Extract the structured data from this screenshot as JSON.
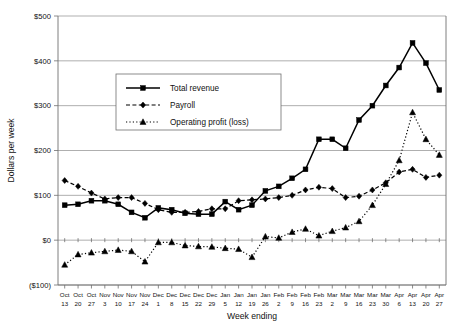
{
  "chart_data": {
    "type": "line",
    "title": "",
    "xlabel": "Week ending",
    "ylabel": "Dollars per week",
    "ylim": [
      -100,
      500
    ],
    "ytick_labels": [
      "$500",
      "$400",
      "$300",
      "$200",
      "$100",
      "$0",
      "($100)"
    ],
    "ytick_values": [
      500,
      400,
      300,
      200,
      100,
      0,
      -100
    ],
    "grid": true,
    "legend_position": "upper-center-left",
    "categories": [
      "Oct 13",
      "Oct 20",
      "Oct 27",
      "Nov 3",
      "Nov 10",
      "Nov 17",
      "Nov 24",
      "Dec 1",
      "Dec 8",
      "Dec 15",
      "Dec 22",
      "Dec 29",
      "Jan 5",
      "Jan 12",
      "Jan 19",
      "Jan 26",
      "Feb 2",
      "Feb 9",
      "Feb 16",
      "Feb 23",
      "Mar 2",
      "Mar 9",
      "Mar 16",
      "Mar 23",
      "Mar 30",
      "Apr 6",
      "Apr 13",
      "Apr 20",
      "Apr 27"
    ],
    "category_months": [
      "Oct",
      "Oct",
      "Oct",
      "Nov",
      "Nov",
      "Nov",
      "Nov",
      "Dec",
      "Dec",
      "Dec",
      "Dec",
      "Dec",
      "Jan",
      "Jan",
      "Jan",
      "Jan",
      "Feb",
      "Feb",
      "Feb",
      "Feb",
      "Mar",
      "Mar",
      "Mar",
      "Mar",
      "Mar",
      "Apr",
      "Apr",
      "Apr",
      "Apr"
    ],
    "category_days": [
      "13",
      "20",
      "27",
      "3",
      "10",
      "17",
      "24",
      "1",
      "8",
      "15",
      "22",
      "29",
      "5",
      "12",
      "19",
      "26",
      "2",
      "9",
      "16",
      "23",
      "2",
      "9",
      "16",
      "23",
      "30",
      "6",
      "13",
      "20",
      "27"
    ],
    "series": [
      {
        "name": "Total revenue",
        "marker": "square",
        "dash": "solid",
        "values": [
          78,
          80,
          88,
          88,
          80,
          62,
          50,
          72,
          68,
          60,
          58,
          58,
          86,
          68,
          78,
          110,
          120,
          138,
          158,
          225,
          225,
          205,
          268,
          300,
          345,
          385,
          440,
          395,
          335
        ]
      },
      {
        "name": "Payroll",
        "marker": "diamond",
        "dash": "dashed",
        "values": [
          133,
          120,
          105,
          92,
          95,
          95,
          82,
          68,
          62,
          62,
          64,
          70,
          70,
          88,
          90,
          92,
          95,
          100,
          112,
          118,
          115,
          95,
          98,
          112,
          128,
          152,
          158,
          140,
          145
        ]
      },
      {
        "name": "Operating profit (loss)",
        "marker": "triangle",
        "dash": "dotted",
        "values": [
          -55,
          -32,
          -28,
          -25,
          -22,
          -25,
          -48,
          -5,
          -5,
          -12,
          -14,
          -15,
          -18,
          -20,
          -38,
          8,
          5,
          18,
          25,
          10,
          20,
          28,
          42,
          78,
          125,
          178,
          285,
          225,
          190
        ]
      }
    ]
  },
  "legend": {
    "items": [
      {
        "label": "Total revenue"
      },
      {
        "label": "Payroll"
      },
      {
        "label": "Operating profit (loss)"
      }
    ]
  }
}
